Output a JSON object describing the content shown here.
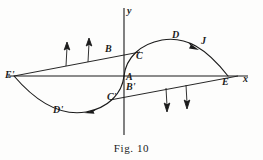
{
  "figure": {
    "caption": "Fig. 10",
    "width": 263,
    "height": 160,
    "ink_color": "#1b1b1b",
    "background_color": "#fdfdfc"
  },
  "axes": {
    "x_axis_label": "x",
    "y_axis_label": "y",
    "origin_x": 124,
    "origin_y": 76,
    "x_axis_from": 8,
    "x_axis_to": 248,
    "y_axis_from": 8,
    "y_axis_to": 135
  },
  "points": [
    {
      "id": "E-prime",
      "label": "E'",
      "x": 14,
      "y": 76,
      "label_x": 8,
      "label_y": 71
    },
    {
      "id": "B",
      "label": "B",
      "x": 112,
      "y": 55,
      "label_x": 107,
      "label_y": 43
    },
    {
      "id": "C",
      "label": "C",
      "x": 134,
      "y": 57,
      "label_x": 137,
      "label_y": 52
    },
    {
      "id": "D",
      "label": "D",
      "x": 176,
      "y": 40,
      "label_x": 174,
      "label_y": 33
    },
    {
      "id": "J",
      "label": "J",
      "x": 199,
      "y": 47,
      "label_x": 200,
      "label_y": 41
    },
    {
      "id": "A",
      "label": "A",
      "x": 124,
      "y": 76,
      "label_x": 127,
      "label_y": 76
    },
    {
      "id": "B-prime",
      "label": "B'",
      "x": 130,
      "y": 88,
      "label_x": 127,
      "label_y": 85
    },
    {
      "id": "C-prime",
      "label": "C'",
      "x": 114,
      "y": 97,
      "label_x": 111,
      "label_y": 94
    },
    {
      "id": "D-prime",
      "label": "D'",
      "x": 68,
      "y": 110,
      "label_x": 54,
      "label_y": 106
    },
    {
      "id": "E",
      "label": "E",
      "x": 228,
      "y": 76,
      "label_x": 224,
      "label_y": 78
    }
  ],
  "curves": [
    {
      "id": "upper-arc",
      "name": "arc-A-C-D-J-E",
      "description": "arc rising from origin A through C and D, over J, down to E on the x-axis",
      "path": "M 124,76 C 126,58 140,44 162,40 C 186,36 206,48 228,76"
    },
    {
      "id": "lower-arc",
      "name": "arc-A-C-prime-D-prime-E-prime",
      "description": "arc descending from origin A through C' and D' to E' on the x-axis",
      "path": "M 124,76 C 122,94 108,108 86,112 C 62,116 38,104 14,76"
    }
  ],
  "secant_lines": [
    {
      "id": "upper-secant",
      "name": "line-E-prime-to-B-to-C",
      "from_x": 14,
      "from_y": 76,
      "to_x": 140,
      "to_y": 52
    },
    {
      "id": "lower-secant",
      "name": "line-C-prime-to-B-prime-to-E",
      "from_x": 110,
      "from_y": 100,
      "to_x": 238,
      "to_y": 76
    }
  ],
  "field_arrows": [
    {
      "id": "up-arrow-1",
      "direction": "up",
      "x1": 66,
      "y1": 66,
      "x2": 67,
      "y2": 46
    },
    {
      "id": "up-arrow-2",
      "direction": "up",
      "x1": 88,
      "y1": 62,
      "x2": 89,
      "y2": 42
    },
    {
      "id": "down-arrow-1",
      "direction": "down",
      "x1": 166,
      "y1": 88,
      "x2": 167,
      "y2": 110
    },
    {
      "id": "down-arrow-2",
      "direction": "down",
      "x1": 186,
      "y1": 85,
      "x2": 187,
      "y2": 107
    }
  ],
  "flow_markers": [
    {
      "id": "upper-flow-marker",
      "on_curve": "upper-arc",
      "direction": "clockwise-rightward",
      "x": 193,
      "y": 45
    },
    {
      "id": "lower-flow-marker",
      "on_curve": "lower-arc",
      "direction": "counter-leftward",
      "x": 94,
      "y": 111
    }
  ]
}
